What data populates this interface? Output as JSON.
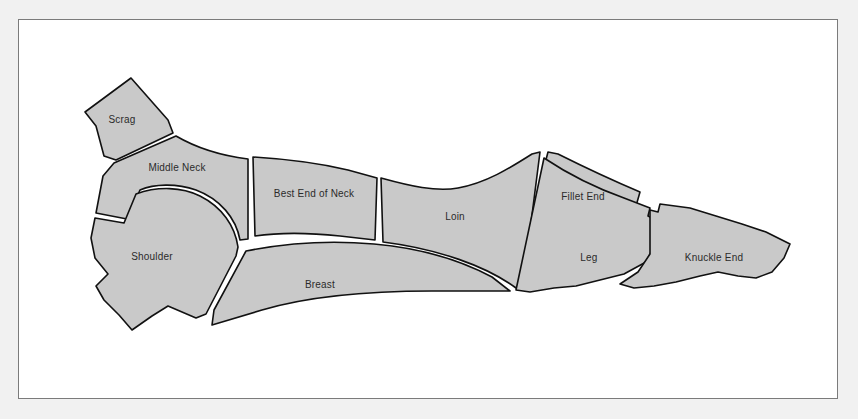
{
  "figure": {
    "kind": "butchery-cuts-diagram",
    "orientation": "side view, head to the left",
    "background_color": "#f1f1f1",
    "panel_color": "#ffffff",
    "frame_border_color": "#7b7b7b",
    "cut_fill_color": "#c9c9c9",
    "cut_outline_color": "#111111",
    "separator_color": "#ffffff",
    "label_color": "#2b2b2b"
  },
  "cuts": [
    {
      "id": "scrag",
      "label": "Scrag",
      "label_x": 122,
      "label_y": 120,
      "fill": "#c9c9c9",
      "path": "M 131 78 L 168 120 L 173 133 L 116 160 L 104 156 L 96 126 L 85 112 Z"
    },
    {
      "id": "middle-neck",
      "label": "Middle Neck",
      "label_x": 177,
      "label_y": 168,
      "fill": "#c9c9c9",
      "path": "M 176 136 C 200 150 224 156 248 159 L 248 239 L 240 240 C 236 218 220 199 196 190 C 176 183 154 184 140 190 L 127 219 L 96 213 L 103 176 L 114 163 Z"
    },
    {
      "id": "shoulder",
      "label": "Shoulder",
      "label_x": 152,
      "label_y": 257,
      "fill": "#c9c9c9",
      "path": "M 136 194 C 158 186 182 187 200 196 C 222 207 235 226 238 247 L 236 256 L 206 314 L 196 318 L 168 306 L 152 316 L 132 330 L 119 315 L 104 300 L 96 286 L 108 274 L 95 258 L 91 238 L 95 218 L 124 223 Z"
    },
    {
      "id": "best-end-of-neck",
      "label": "Best End of Neck",
      "label_x": 314,
      "label_y": 194,
      "fill": "#c9c9c9",
      "path": "M 253 157 C 286 159 318 163 348 170 L 377 178 L 375 240 L 340 236 C 312 233 282 232 255 236 Z"
    },
    {
      "id": "breast",
      "label": "Breast",
      "label_x": 320,
      "label_y": 285,
      "fill": "#c9c9c9",
      "path": "M 246 251 C 286 243 330 240 374 244 C 420 248 460 260 492 277 L 510 291 L 432 291 C 380 291 316 294 262 310 L 212 325 L 214 310 Z"
    },
    {
      "id": "loin",
      "label": "Loin",
      "label_x": 455,
      "label_y": 217,
      "fill": "#c9c9c9",
      "path": "M 381 178 C 410 186 436 192 458 188 C 486 183 510 168 532 154 L 540 152 L 524 278 L 516 288 C 486 266 438 249 383 242 Z"
    },
    {
      "id": "fillet-end",
      "label": "Fillet End",
      "label_x": 583,
      "label_y": 197,
      "fill": "#c9c9c9",
      "path": "M 548 152 L 558 154 C 586 168 614 181 640 192 L 634 213 C 608 207 578 204 548 206 L 534 206 Z"
    },
    {
      "id": "leg",
      "label": "Leg",
      "label_x": 589,
      "label_y": 258,
      "fill": "#c9c9c9",
      "path": "M 544 158 C 568 174 596 188 624 198 L 650 208 L 648 216 L 660 222 L 654 246 L 646 262 L 624 274 L 600 280 L 576 286 L 554 288 L 530 292 L 516 290 Z"
    },
    {
      "id": "knuckle-end",
      "label": "Knuckle End",
      "label_x": 714,
      "label_y": 258,
      "fill": "#c9c9c9",
      "path": "M 650 210 L 658 212 L 660 204 L 690 208 L 716 216 L 742 224 L 766 232 L 790 244 L 784 258 L 772 272 L 756 278 L 738 276 L 718 272 L 700 276 L 676 282 L 654 286 L 634 288 L 620 284 L 638 272 L 650 254 Z"
    }
  ]
}
